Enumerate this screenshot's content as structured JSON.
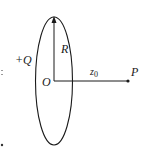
{
  "diagram": {
    "type": "charged-ring-axis",
    "labels": {
      "charge": "+Q",
      "radius": "R",
      "origin": "O",
      "distance": "z",
      "distance_sub": "0",
      "point": "P"
    },
    "colors": {
      "stroke": "#1a1a1a",
      "background": "#ffffff"
    }
  }
}
